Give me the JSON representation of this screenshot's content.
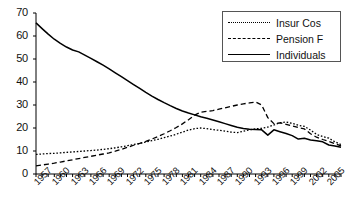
{
  "chart_data": {
    "type": "line",
    "title": "",
    "subtitle": "",
    "xlabel": "",
    "ylabel": "",
    "xlim": [
      1957,
      2007
    ],
    "ylim": [
      0,
      70
    ],
    "yticks": [
      0,
      10,
      20,
      30,
      40,
      50,
      60,
      70
    ],
    "grid": false,
    "legend_position": "top-right",
    "x": [
      1957,
      1958,
      1959,
      1960,
      1961,
      1962,
      1963,
      1964,
      1965,
      1966,
      1967,
      1968,
      1969,
      1970,
      1971,
      1972,
      1973,
      1974,
      1975,
      1976,
      1977,
      1978,
      1979,
      1980,
      1981,
      1982,
      1983,
      1984,
      1985,
      1986,
      1987,
      1988,
      1989,
      1990,
      1991,
      1992,
      1993,
      1994,
      1995,
      1996,
      1997,
      1998,
      1999,
      2000,
      2001,
      2002,
      2003,
      2004,
      2005,
      2006,
      2007
    ],
    "xtick_labels": [
      "1957",
      "1960",
      "1963",
      "1966",
      "1969",
      "1972",
      "1975",
      "1978",
      "1981",
      "1984",
      "1987",
      "1990",
      "1993",
      "1996",
      "1999",
      "2002",
      "2005"
    ],
    "series": [
      {
        "name": "Insur Cos",
        "style": "dotted",
        "color": "#000000",
        "values": [
          8.5,
          8.7,
          8.9,
          9.0,
          9.2,
          9.4,
          9.6,
          9.8,
          10.0,
          10.2,
          10.4,
          10.7,
          11.0,
          11.4,
          11.8,
          12.3,
          12.8,
          13.3,
          13.9,
          14.5,
          15.1,
          15.8,
          16.5,
          17.3,
          18.2,
          19.1,
          19.7,
          20.0,
          19.7,
          19.3,
          19.0,
          18.6,
          18.2,
          18.0,
          18.6,
          19.2,
          19.6,
          19.9,
          20.4,
          21.3,
          22.3,
          22.6,
          22.0,
          21.2,
          20.7,
          19.1,
          17.2,
          16.3,
          15.6,
          14.0,
          12.8
        ]
      },
      {
        "name": "Pension F",
        "style": "dashed",
        "color": "#000000",
        "values": [
          3.5,
          3.9,
          4.3,
          4.7,
          5.2,
          5.7,
          6.2,
          6.7,
          7.2,
          7.7,
          8.2,
          8.7,
          9.2,
          9.9,
          10.7,
          11.6,
          12.5,
          13.3,
          14.2,
          15.2,
          16.3,
          17.5,
          18.8,
          20.2,
          21.8,
          23.6,
          25.6,
          26.9,
          27.2,
          27.6,
          28.2,
          28.8,
          29.4,
          30.0,
          30.5,
          30.9,
          31.3,
          30.0,
          24.5,
          21.9,
          22.2,
          21.6,
          20.9,
          20.2,
          19.6,
          17.5,
          16.0,
          15.0,
          14.2,
          13.2,
          12.2
        ]
      },
      {
        "name": "Individuals",
        "style": "solid",
        "color": "#000000",
        "values": [
          65.7,
          63.2,
          60.8,
          58.6,
          56.8,
          55.2,
          53.9,
          53.1,
          51.7,
          50.3,
          48.8,
          47.3,
          45.7,
          44.0,
          42.3,
          40.6,
          38.9,
          37.2,
          35.5,
          33.9,
          32.4,
          31.0,
          29.7,
          28.5,
          27.4,
          26.5,
          25.7,
          24.9,
          24.2,
          23.5,
          22.7,
          21.9,
          21.1,
          20.3,
          19.8,
          19.5,
          19.4,
          19.2,
          16.9,
          19.2,
          18.4,
          17.6,
          16.7,
          15.2,
          15.5,
          14.8,
          14.5,
          14.0,
          12.6,
          12.2,
          11.6
        ]
      }
    ]
  }
}
